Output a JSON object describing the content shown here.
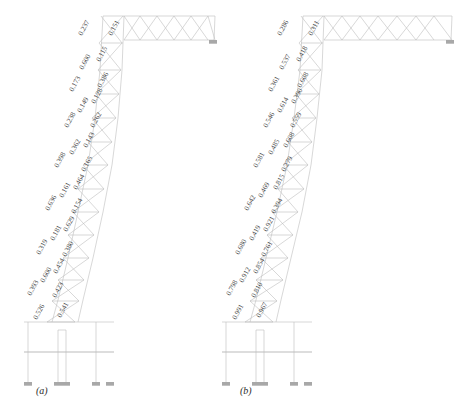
{
  "figure": {
    "type": "structural-mode-shape-diagram",
    "panels": [
      {
        "id": "a",
        "caption": "(a)",
        "labels": [
          "0.237",
          "0.151",
          "0.600",
          "0.115",
          "0.173",
          "0.386",
          "0.149",
          "0.128",
          "0.238",
          "0.262",
          "0.362",
          "0.143",
          "0.398",
          "0.165",
          "0.161",
          "0.464",
          "0.636",
          "0.154",
          "0.181",
          "0.629",
          "0.319",
          "0.380",
          "0.600",
          "0.454",
          "0.393",
          "0.423",
          "0.526",
          "0.541"
        ]
      },
      {
        "id": "b",
        "caption": "(b)",
        "labels": [
          "0.286",
          "0.311",
          "0.537",
          "0.418",
          "0.361",
          "0.608",
          "0.614",
          "0.390",
          "0.546",
          "0.559",
          "0.485",
          "0.608",
          "0.581",
          "0.279",
          "0.469",
          "0.815",
          "0.642",
          "0.394",
          "0.419",
          "0.921",
          "0.680",
          "0.761",
          "0.912",
          "0.854",
          "0.798",
          "0.810",
          "0.991",
          "0.967"
        ]
      }
    ],
    "colors": {
      "structure": "#b9b9b9",
      "label": "#4a4a4a",
      "caption": "#2b2b2b",
      "background": "#ffffff"
    }
  }
}
